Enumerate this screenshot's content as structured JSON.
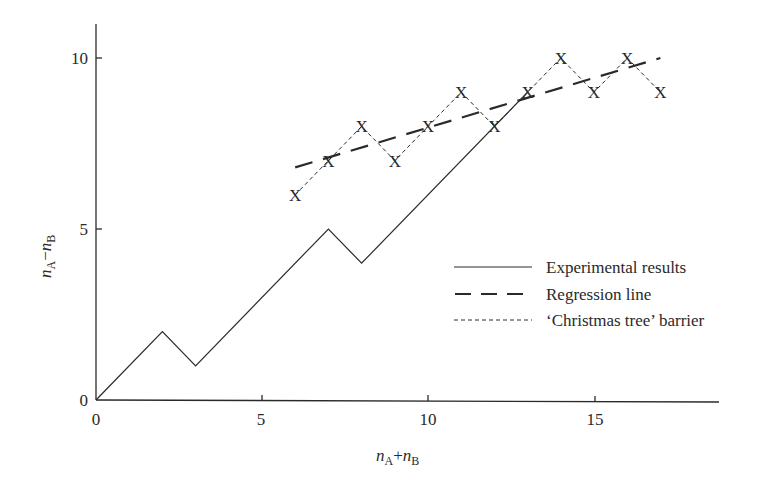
{
  "chart_data": {
    "type": "line",
    "title": "",
    "xlabel": "n_A + n_B",
    "ylabel": "n_A − n_B",
    "xlim": [
      0,
      18.8
    ],
    "ylim": [
      0,
      11
    ],
    "x_ticks": [
      0,
      5,
      10,
      15
    ],
    "y_ticks": [
      0,
      5,
      10
    ],
    "grid": false,
    "legend_position": "center-right",
    "series": [
      {
        "name": "Experimental results",
        "style": "solid",
        "x": [
          0,
          2,
          3,
          7,
          8,
          13
        ],
        "y": [
          0,
          2,
          1,
          5,
          4,
          9
        ]
      },
      {
        "name": "Regression line",
        "style": "long-dash",
        "x": [
          6,
          17
        ],
        "y": [
          6.8,
          10
        ]
      },
      {
        "name": "'Christmas tree' barrier",
        "style": "short-dash",
        "marker": "X",
        "x": [
          6,
          7,
          8,
          9,
          10,
          11,
          12,
          13,
          14,
          15,
          16,
          17
        ],
        "y": [
          6,
          7,
          8,
          7,
          8,
          9,
          8,
          9,
          10,
          9,
          10,
          9
        ]
      }
    ]
  },
  "axes": {
    "x_label_main": "n",
    "x_label_sub1": "A",
    "x_label_op": "+",
    "x_label_main2": "n",
    "x_label_sub2": "B",
    "y_label_main": "n",
    "y_label_sub1": "A",
    "y_label_op": "−",
    "y_label_main2": "n",
    "y_label_sub2": "B",
    "x_tick_labels": [
      "0",
      "5",
      "10",
      "15"
    ],
    "y_tick_labels": [
      "0",
      "5",
      "10"
    ]
  },
  "legend": {
    "items": [
      {
        "label": "Experimental results"
      },
      {
        "label": "Regression line"
      },
      {
        "label": "‘Christmas tree’ barrier"
      }
    ]
  },
  "marker_glyph": "X",
  "colors": {
    "ink": "#2a2a2a",
    "background": "#ffffff"
  }
}
